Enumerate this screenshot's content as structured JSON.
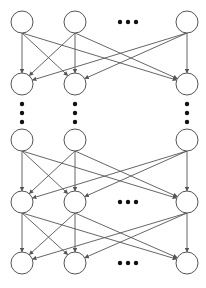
{
  "diagram": {
    "type": "layered-network",
    "colors": {
      "background": "#ffffff",
      "stroke": "#555555",
      "node_fill": "#ffffff",
      "dots": "#111111"
    },
    "node_radius": 11,
    "columns_x": [
      22,
      75,
      187
    ],
    "rows": [
      {
        "id": "layer-1",
        "y": 22,
        "horizontal_ellipsis": true
      },
      {
        "id": "layer-2",
        "y": 84,
        "horizontal_ellipsis": false
      },
      {
        "id": "layer-n-2",
        "y": 140,
        "horizontal_ellipsis": false
      },
      {
        "id": "layer-n-1",
        "y": 202,
        "horizontal_ellipsis": true
      },
      {
        "id": "layer-n",
        "y": 263,
        "horizontal_ellipsis": true
      }
    ],
    "connections": [
      {
        "from_row": 0,
        "to_row": 1
      },
      {
        "from_row": 2,
        "to_row": 3
      },
      {
        "from_row": 3,
        "to_row": 4
      }
    ],
    "vertical_ellipsis": {
      "y_values": [
        104,
        113,
        122
      ]
    },
    "horizontal_ellipsis_x": [
      120,
      128,
      136
    ],
    "ellipsis_symbol": "•••"
  }
}
